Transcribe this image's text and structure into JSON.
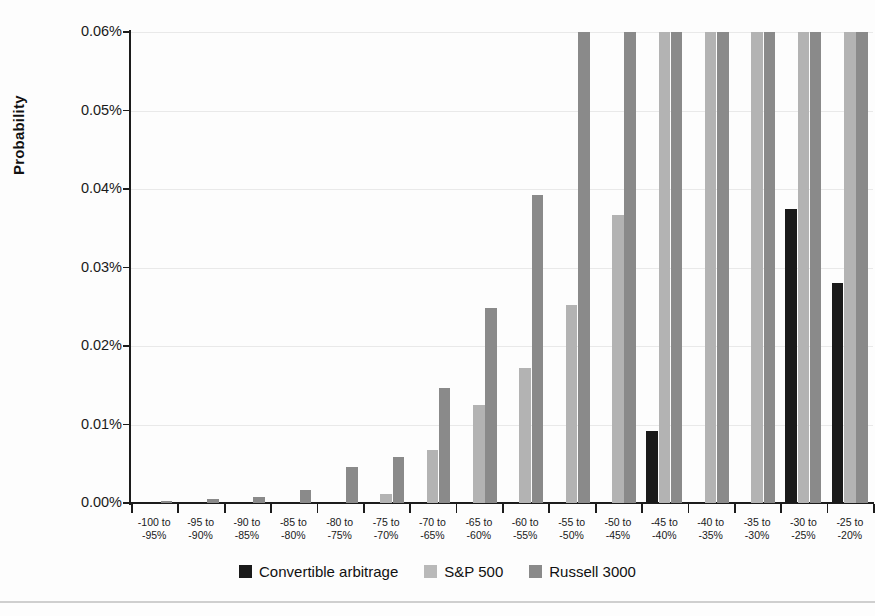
{
  "chart_data": {
    "type": "bar",
    "title": "",
    "xlabel": "",
    "ylabel": "Probability",
    "ylim": [
      0,
      0.06
    ],
    "yticks": [
      0,
      0.01,
      0.02,
      0.03,
      0.04,
      0.05,
      0.06
    ],
    "ytick_labels": [
      "0.00%",
      "0.01%",
      "0.02%",
      "0.03%",
      "0.04%",
      "0.05%",
      "0.06%"
    ],
    "grid": true,
    "legend_position": "bottom",
    "value_unit": "percent",
    "note": "Bars reaching 0.06% are clipped at the top of the axis.",
    "categories": [
      "-100 to\n-95%",
      "-95 to\n-90%",
      "-90 to\n-85%",
      "-85 to\n-80%",
      "-80 to\n-75%",
      "-75 to\n-70%",
      "-70 to\n-65%",
      "-65 to\n-60%",
      "-60 to\n-55%",
      "-55 to\n-50%",
      "-50 to\n-45%",
      "-45 to\n-40%",
      "-40 to\n-35%",
      "-35 to\n-30%",
      "-30 to\n-25%",
      "-25 to\n-20%"
    ],
    "category_lines": [
      [
        "-100 to",
        "-95%"
      ],
      [
        "-95 to",
        "-90%"
      ],
      [
        "-90 to",
        "-85%"
      ],
      [
        "-85 to",
        "-80%"
      ],
      [
        "-80 to",
        "-75%"
      ],
      [
        "-75 to",
        "-70%"
      ],
      [
        "-70 to",
        "-65%"
      ],
      [
        "-65 to",
        "-60%"
      ],
      [
        "-60 to",
        "-55%"
      ],
      [
        "-55 to",
        "-50%"
      ],
      [
        "-50 to",
        "-45%"
      ],
      [
        "-45 to",
        "-40%"
      ],
      [
        "-40 to",
        "-35%"
      ],
      [
        "-35 to",
        "-30%"
      ],
      [
        "-30 to",
        "-25%"
      ],
      [
        "-25 to",
        "-20%"
      ]
    ],
    "series": [
      {
        "name": "Convertible arbitrage",
        "color": "#1a1a1a",
        "values": [
          0,
          0,
          0,
          0,
          0,
          0,
          0,
          0,
          0,
          0,
          0,
          0.0092,
          0,
          0,
          0.0375,
          0.028
        ]
      },
      {
        "name": "S&P 500",
        "color": "#b3b3b3",
        "values": [
          0,
          0,
          0,
          0,
          0,
          0.0012,
          0.0068,
          0.0125,
          0.0172,
          0.0252,
          0.0367,
          0.06,
          0.06,
          0.06,
          0.06,
          0.06
        ]
      },
      {
        "name": "Russell 3000",
        "color": "#8a8a8a",
        "values": [
          0.0003,
          0.0005,
          0.0008,
          0.0017,
          0.0046,
          0.0058,
          0.0147,
          0.0248,
          0.0393,
          0.06,
          0.06,
          0.06,
          0.06,
          0.06,
          0.06,
          0.06
        ]
      }
    ]
  },
  "legend": {
    "items": [
      {
        "label": "Convertible arbitrage",
        "swatch": "conv"
      },
      {
        "label": "S&P 500",
        "swatch": "sp"
      },
      {
        "label": "Russell 3000",
        "swatch": "rus"
      }
    ]
  }
}
